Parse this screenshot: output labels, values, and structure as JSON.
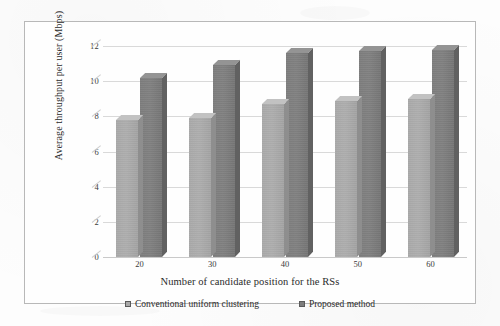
{
  "chart_data": {
    "type": "bar",
    "title": "",
    "subtitle": "",
    "xlabel": "Number of candidate position for the RSs",
    "ylabel": "Average throughput per user (Mbps)",
    "categories": [
      "20",
      "30",
      "40",
      "50",
      "60"
    ],
    "series": [
      {
        "name": "Conventional uniform clustering",
        "color": "#a9a9a9",
        "values": [
          7.8,
          7.9,
          8.7,
          8.9,
          9.0
        ]
      },
      {
        "name": "Proposed method",
        "color": "#7d7d7d",
        "values": [
          10.2,
          10.9,
          11.6,
          11.7,
          11.8
        ]
      }
    ],
    "ylim": [
      0,
      12
    ],
    "ytick_values": [
      0,
      2,
      4,
      6,
      8,
      10,
      12
    ],
    "ytick_labels": [
      "0",
      "2",
      "4",
      "6",
      "8",
      "10",
      "12"
    ],
    "grid": true,
    "grid_axis": "y",
    "legend_position": "bottom",
    "style": "3d-column",
    "background": "#fefefe",
    "border_color": "#b8b8b8"
  },
  "legend": {
    "items": [
      {
        "label": "Conventional uniform clustering",
        "swatch": "legend-swatch-conventional"
      },
      {
        "label": "Proposed method",
        "swatch": "legend-swatch-proposed"
      }
    ]
  }
}
